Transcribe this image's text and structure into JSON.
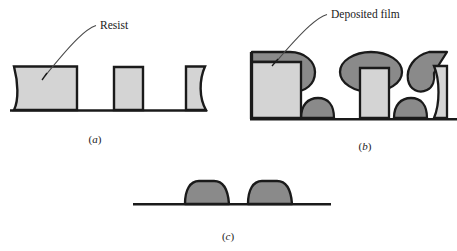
{
  "figure": {
    "background_color": "#ffffff",
    "outline_color": "#1a1a1a",
    "resist_fill_color": "#d4d4d4",
    "film_fill_color": "#8a8a8a",
    "panels": [
      {
        "id": "a",
        "caption": "(a)",
        "caption_open": "(",
        "caption_letter": "a",
        "caption_close": ")",
        "annotation": {
          "label": "Resist",
          "leader": "leader-line"
        },
        "description": "Patterned resist blocks on a substrate"
      },
      {
        "id": "b",
        "caption": "(b)",
        "caption_open": "(",
        "caption_letter": "b",
        "caption_close": ")",
        "annotation": {
          "label": "Deposited film",
          "leader": "leader-line"
        },
        "description": "Deposited film covering resist tops and exposed substrate"
      },
      {
        "id": "c",
        "caption": "(c)",
        "caption_open": "(",
        "caption_letter": "c",
        "caption_close": ")",
        "annotation": null,
        "description": "Remaining film features after resist lift-off"
      }
    ]
  }
}
